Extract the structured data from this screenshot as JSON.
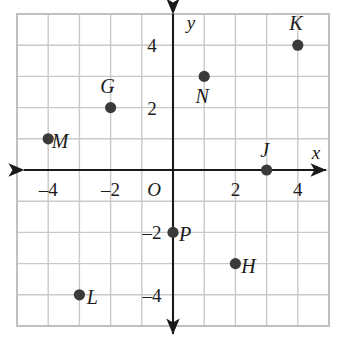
{
  "figure": {
    "origin_label": "O",
    "x_axis_label": "x",
    "y_axis_label": "y"
  },
  "chart_data": {
    "type": "scatter",
    "title": "",
    "xlabel": "x",
    "ylabel": "y",
    "xlim": [
      -5,
      5
    ],
    "ylim": [
      -5,
      5
    ],
    "grid": true,
    "grid_step": 1,
    "legend": "none",
    "origin_label": "O",
    "x_ticks": [
      -4,
      -2,
      2,
      4
    ],
    "x_tick_labels": [
      "–4",
      "–2",
      "2",
      "4"
    ],
    "y_ticks": [
      4,
      2,
      -2,
      -4
    ],
    "y_tick_labels": [
      "4",
      "2",
      "–2",
      "–4"
    ],
    "points": [
      {
        "label": "K",
        "x": 4,
        "y": 4,
        "label_dx": -2,
        "label_dy": -22
      },
      {
        "label": "N",
        "x": 1,
        "y": 3,
        "label_dx": -2,
        "label_dy": 20
      },
      {
        "label": "G",
        "x": -2,
        "y": 2,
        "label_dx": -3,
        "label_dy": -22
      },
      {
        "label": "M",
        "x": -4,
        "y": 1,
        "label_dx": 12,
        "label_dy": 2
      },
      {
        "label": "J",
        "x": 3,
        "y": 0,
        "label_dx": -2,
        "label_dy": -20
      },
      {
        "label": "P",
        "x": 0,
        "y": -2,
        "label_dx": 12,
        "label_dy": 2
      },
      {
        "label": "H",
        "x": 2,
        "y": -3,
        "label_dx": 13,
        "label_dy": 2
      },
      {
        "label": "L",
        "x": -3,
        "y": -4,
        "label_dx": 13,
        "label_dy": 2
      }
    ]
  },
  "style": {
    "grid_color": "#c9c9c9",
    "border_color": "#c0c0c0",
    "axis_color": "#1a1a1a",
    "point_color": "#3a3a3a",
    "background": "#ffffff"
  }
}
